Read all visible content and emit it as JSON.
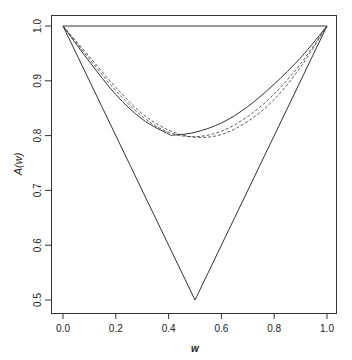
{
  "chart_data": {
    "type": "line",
    "title": "",
    "xlabel": "w",
    "ylabel": "A(w)",
    "xlim": [
      0,
      1
    ],
    "ylim": [
      0.5,
      1.0
    ],
    "x_ticks": [
      "0.0",
      "0.2",
      "0.4",
      "0.6",
      "0.8",
      "1.0"
    ],
    "y_ticks": [
      "0.5",
      "0.6",
      "0.7",
      "0.8",
      "0.9",
      "1.0"
    ],
    "grid": false,
    "legend": null,
    "series": [
      {
        "name": "upper bound (independence)",
        "style": "solid",
        "x": [
          0,
          1
        ],
        "y": [
          1.0,
          1.0
        ]
      },
      {
        "name": "lower bound max(w,1-w)",
        "style": "solid",
        "x": [
          0,
          0.5,
          1
        ],
        "y": [
          1.0,
          0.5,
          1.0
        ]
      },
      {
        "name": "estimate",
        "style": "solid",
        "x": [
          0,
          0.1,
          0.2,
          0.3,
          0.4,
          0.42,
          0.5,
          0.6,
          0.7,
          0.8,
          0.9,
          1.0
        ],
        "y": [
          1.0,
          0.935,
          0.875,
          0.83,
          0.803,
          0.801,
          0.806,
          0.823,
          0.853,
          0.894,
          0.942,
          1.0
        ]
      },
      {
        "name": "dashed estimate 1",
        "style": "dashed",
        "x": [
          0,
          0.1,
          0.2,
          0.3,
          0.4,
          0.5,
          0.6,
          0.7,
          0.8,
          0.9,
          1.0
        ],
        "y": [
          1.0,
          0.94,
          0.882,
          0.835,
          0.806,
          0.798,
          0.808,
          0.835,
          0.876,
          0.931,
          1.0
        ]
      },
      {
        "name": "dashed estimate 2",
        "style": "dashed",
        "x": [
          0,
          0.1,
          0.2,
          0.3,
          0.4,
          0.5,
          0.6,
          0.7,
          0.8,
          0.9,
          1.0
        ],
        "y": [
          1.0,
          0.944,
          0.888,
          0.84,
          0.81,
          0.797,
          0.802,
          0.826,
          0.866,
          0.925,
          1.0
        ]
      }
    ]
  }
}
